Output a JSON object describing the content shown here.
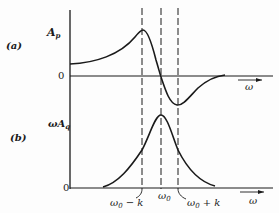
{
  "panels": {
    "a": {
      "tag": "(a)",
      "ylabel_main": "A",
      "ylabel_sub": "p",
      "zero": "0",
      "xlabel": "ω"
    },
    "b": {
      "tag": "(b)",
      "ylabel_main": "ωA",
      "ylabel_sub": "q",
      "zero": "0",
      "xlabel": "ω"
    }
  },
  "markers": {
    "left": {
      "main": "ω",
      "sub": "0",
      "suffix": " − k"
    },
    "center": {
      "main": "ω",
      "sub": "0"
    },
    "right": {
      "main": "ω",
      "sub": "0",
      "suffix": " + k"
    }
  },
  "colors": {
    "ink": "#1a1a1a",
    "background": "#fdfdfd"
  }
}
